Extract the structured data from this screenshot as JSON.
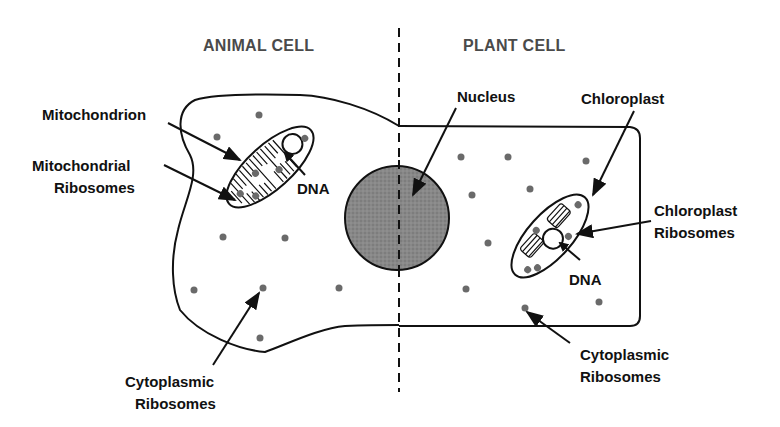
{
  "headers": {
    "animal": "ANIMAL CELL",
    "plant": "PLANT CELL"
  },
  "labels": {
    "mitochondrion": "Mitochondrion",
    "mito_ribosomes_1": "Mitochondrial",
    "mito_ribosomes_2": "Ribosomes",
    "mito_dna": "DNA",
    "nucleus": "Nucleus",
    "chloroplast": "Chloroplast",
    "chloro_ribosomes_1": "Chloroplast",
    "chloro_ribosomes_2": "Ribosomes",
    "chloro_dna": "DNA",
    "animal_cyto_1": "Cytoplasmic",
    "animal_cyto_2": "Ribosomes",
    "plant_cyto_1": "Cytoplasmic",
    "plant_cyto_2": "Ribosomes"
  },
  "colors": {
    "outline": "#111111",
    "nucleus_fill": "#7a7a7a",
    "ribosome": "#6a6a6a",
    "header_text": "#4a4a4a"
  }
}
